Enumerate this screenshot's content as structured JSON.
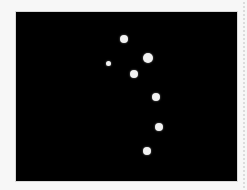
{
  "image": {
    "background_color": "#000000",
    "dot_color": "#f2f2f2",
    "frame": {
      "x": 16,
      "y": 12,
      "width": 221,
      "height": 169
    },
    "dots": [
      {
        "cx": 124,
        "cy": 39,
        "r": 4
      },
      {
        "cx": 148,
        "cy": 58,
        "r": 5
      },
      {
        "cx": 108,
        "cy": 63,
        "r": 2.5
      },
      {
        "cx": 134,
        "cy": 74,
        "r": 4
      },
      {
        "cx": 156,
        "cy": 97,
        "r": 4
      },
      {
        "cx": 159,
        "cy": 127,
        "r": 4
      },
      {
        "cx": 147,
        "cy": 151,
        "r": 4
      }
    ]
  }
}
